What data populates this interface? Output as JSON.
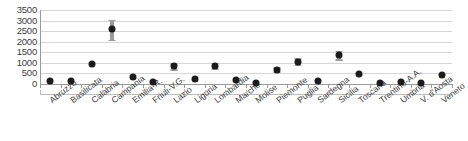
{
  "chart_data": {
    "type": "scatter",
    "title": "",
    "subtitle": "",
    "xlabel": "",
    "ylabel": "",
    "ylim": [
      0,
      3500
    ],
    "ytick_labels": [
      "3500",
      "3000",
      "2500",
      "2000",
      "1500",
      "1000",
      "500",
      "0"
    ],
    "ytick_values": [
      3500,
      3000,
      2500,
      2000,
      1500,
      1000,
      500,
      0
    ],
    "grid": true,
    "grid_axis": "y",
    "legend": "none",
    "categories": [
      "Abruzzo",
      "Basilicata",
      "Calabria",
      "Campania",
      "Emilia-R.",
      "Friuli-V.G.",
      "Lazio",
      "Liguria",
      "Lombardia",
      "Marche",
      "Molise",
      "Piemonte",
      "Puglia",
      "Sardegna",
      "Sicilia",
      "Toscana",
      "Trentino-A.A.",
      "Umbria",
      "V. d'Aosta",
      "Veneto"
    ],
    "series": [
      {
        "name": "value",
        "values": [
          150,
          120,
          950,
          2580,
          350,
          90,
          830,
          240,
          870,
          190,
          50,
          680,
          1050,
          120,
          1370,
          450,
          70,
          90,
          30,
          420
        ],
        "error_low": [
          150,
          120,
          950,
          2100,
          350,
          90,
          700,
          240,
          740,
          190,
          50,
          570,
          900,
          120,
          1180,
          450,
          70,
          90,
          30,
          420
        ],
        "error_high": [
          150,
          120,
          950,
          3050,
          350,
          90,
          980,
          240,
          1010,
          190,
          50,
          800,
          1210,
          120,
          1570,
          450,
          70,
          90,
          30,
          420
        ]
      }
    ],
    "marker_color": "#1b1b1b",
    "error_color": "#9b9b9b",
    "grid_color": "#d6d6d6",
    "axis_color": "#9a9a9a"
  }
}
